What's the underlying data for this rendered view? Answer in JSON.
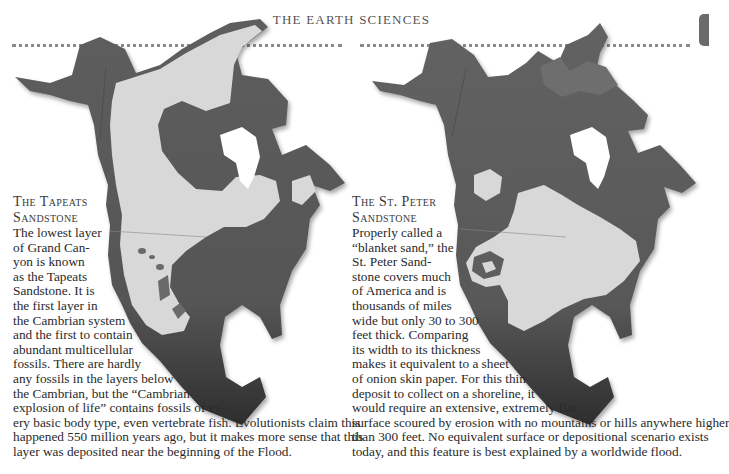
{
  "page": {
    "running_head": "THE EARTH SCIENCES",
    "tab_marker_color": "#6b6b6b"
  },
  "colors": {
    "land_dark": "#5a5a5a",
    "land_mid": "#777777",
    "sandstone_light": "#d9d9d9",
    "water_white": "#ffffff",
    "rule": "#8a8a8a"
  },
  "left_feature": {
    "map_label": "tapeats-sandstone-extent-map",
    "title_line1": "The Tapeats",
    "title_line2": "Sandstone",
    "lines": [
      "The lowest layer",
      "of Grand Can-",
      "yon is known",
      "as the Tapeats",
      "Sandstone. It is",
      "the first layer  in",
      "the Cambrian system",
      "and the first to contain",
      "abundant multicellular",
      "fossils. There are hardly",
      "any fossils in the layers below",
      "the Cambrian, but the “Cambrian",
      "explosion of life” contains fossils of ev-",
      "ery basic body type, even vertebrate fish. Evolutionists claim this",
      "happened 550 million years ago, but it makes more sense that this",
      "layer was deposited near the beginning of the Flood."
    ]
  },
  "right_feature": {
    "map_label": "st-peter-sandstone-extent-map",
    "title_line1": "The St. Peter",
    "title_line2": "Sandstone",
    "lines": [
      "Properly called a",
      "“blanket sand,” the",
      "St. Peter Sand-",
      "stone covers much",
      "of America and is",
      "thousands of miles",
      "wide but only 30 to 300",
      "feet thick. Comparing",
      "its width to its thickness",
      "makes it equivalent to a sheet",
      "of onion skin paper. For this thin",
      "deposit to collect on a shoreline, it",
      "would require an extensive, extremely flat",
      "surface scoured by erosion with no mountains or hills anywhere higher",
      "than 300 feet. No equivalent surface or depositional scenario exists",
      "today, and this feature is best explained by a worldwide flood."
    ]
  }
}
